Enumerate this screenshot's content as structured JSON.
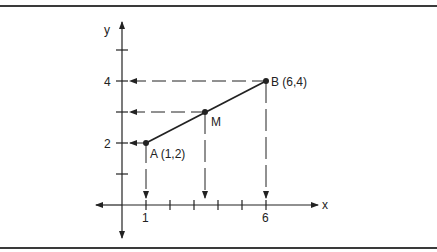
{
  "figure": {
    "axes": {
      "x_label": "x",
      "y_label": "y",
      "x_ticks_labeled": [
        {
          "value": 1,
          "label": "1"
        },
        {
          "value": 6,
          "label": "6"
        }
      ],
      "y_ticks_labeled": [
        {
          "value": 2,
          "label": "2"
        },
        {
          "value": 4,
          "label": "4"
        }
      ],
      "x_tick_values": [
        1,
        2,
        3,
        4,
        5,
        6
      ],
      "y_tick_values": [
        1,
        2,
        3,
        4,
        5
      ]
    },
    "points": [
      {
        "name": "A",
        "label": "A (1,2)",
        "x": 1,
        "y": 2
      },
      {
        "name": "M",
        "label": "M",
        "x": 3.5,
        "y": 3
      },
      {
        "name": "B",
        "label": "B (6,4)",
        "x": 6,
        "y": 4
      }
    ],
    "segment": {
      "from": "A",
      "to": "B",
      "midpoint": "M"
    },
    "projections": {
      "horizontal_to_y_axis": [
        "A",
        "M",
        "B"
      ],
      "vertical_to_x_axis": [
        "A",
        "M",
        "B"
      ],
      "style": "dashed-arrow"
    },
    "colors": {
      "ink": "#222222",
      "rule": "#3a3a3a",
      "background": "#ffffff"
    }
  }
}
